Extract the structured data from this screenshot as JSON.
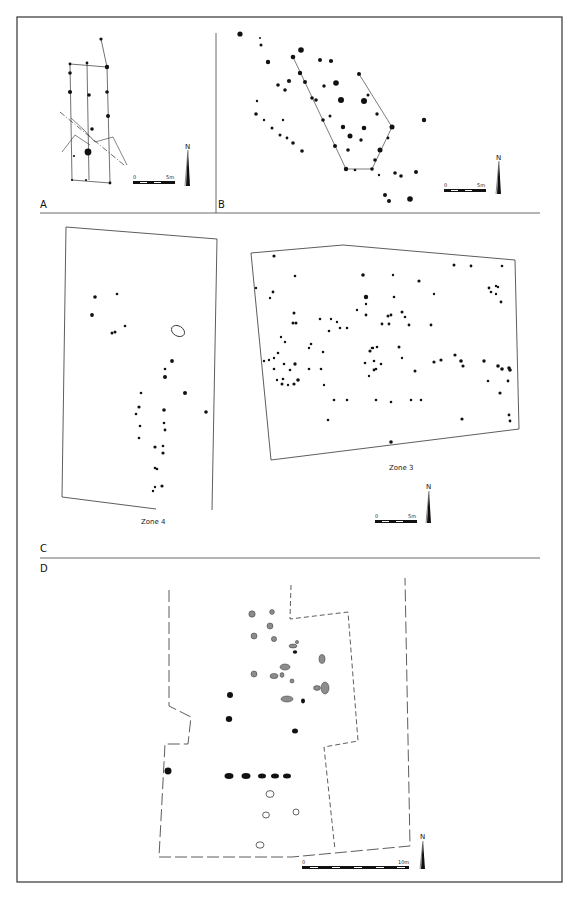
{
  "header_fragment": "",
  "panels": {
    "A": {
      "label": "A",
      "scale": {
        "start": "0",
        "end": "5m"
      },
      "north": "N"
    },
    "B": {
      "label": "B",
      "scale": {
        "start": "0",
        "end": "5m"
      },
      "north": "N"
    },
    "C": {
      "label": "C",
      "zone4_label": "Zone 4",
      "zone3_label": "Zone 3",
      "scale": {
        "start": "0",
        "end": "5m"
      },
      "north": "N"
    },
    "D": {
      "label": "D",
      "scale": {
        "start": "0",
        "end": "10m"
      },
      "north": "N"
    }
  },
  "colors": {
    "ink": "#111111",
    "frame": "#333333",
    "grey_fill": "#8c8c8c"
  },
  "geometry": {
    "A_posts": [
      [
        101,
        39,
        1.6
      ],
      [
        70,
        64,
        1.4
      ],
      [
        87,
        63,
        1.4
      ],
      [
        107,
        67,
        2.2
      ],
      [
        70,
        73,
        1.8
      ],
      [
        70,
        92,
        2.1
      ],
      [
        89,
        95,
        1.8
      ],
      [
        107,
        92,
        1.8
      ],
      [
        108,
        116,
        2.0
      ],
      [
        92,
        129,
        1.8
      ],
      [
        88,
        152,
        3.4
      ],
      [
        74,
        156,
        1.1
      ],
      [
        72,
        180,
        1.1
      ],
      [
        86,
        180,
        1.1
      ],
      [
        110,
        183,
        1.4
      ]
    ],
    "A_lines": [
      [
        [
          101,
          39
        ],
        [
          107,
          67
        ]
      ],
      [
        [
          70,
          64
        ],
        [
          107,
          67
        ]
      ],
      [
        [
          70,
          64
        ],
        [
          72,
          180
        ]
      ],
      [
        [
          87,
          63
        ],
        [
          89,
          180
        ]
      ],
      [
        [
          107,
          67
        ],
        [
          110,
          183
        ]
      ],
      [
        [
          72,
          180
        ],
        [
          110,
          183
        ]
      ]
    ],
    "A_dash": [
      [
        [
          60,
          112
        ],
        [
          124,
          165
        ]
      ]
    ],
    "A_trench": [
      [
        [
          71,
          118
        ],
        [
          84,
          130
        ],
        [
          95,
          142
        ],
        [
          113,
          137
        ],
        [
          127,
          165
        ]
      ],
      [
        [
          62,
          152
        ],
        [
          75,
          135
        ],
        [
          90,
          145
        ]
      ]
    ],
    "B_posts": [
      [
        240,
        34,
        2.6
      ],
      [
        260,
        38,
        1
      ],
      [
        261,
        45,
        1.5
      ],
      [
        301,
        50,
        2.8
      ],
      [
        268,
        62,
        2.2
      ],
      [
        293,
        57,
        2.3
      ],
      [
        320,
        60,
        2
      ],
      [
        331,
        61,
        2.1
      ],
      [
        300,
        73,
        2.2
      ],
      [
        289,
        81,
        2.1
      ],
      [
        359,
        74,
        2
      ],
      [
        305,
        82,
        2
      ],
      [
        336,
        83,
        2.8
      ],
      [
        278,
        85,
        1.8
      ],
      [
        285,
        90,
        1.8
      ],
      [
        324,
        86,
        1.7
      ],
      [
        312,
        98,
        1.8
      ],
      [
        316,
        100,
        1.8
      ],
      [
        341,
        100,
        3.0
      ],
      [
        364,
        101,
        3.0
      ],
      [
        368,
        95,
        1.5
      ],
      [
        257,
        101,
        1.2
      ],
      [
        256,
        114,
        1.8
      ],
      [
        264,
        120,
        1.2
      ],
      [
        283,
        120,
        1.2
      ],
      [
        323,
        120,
        1.8
      ],
      [
        330,
        116,
        1.5
      ],
      [
        377,
        114,
        1.7
      ],
      [
        424,
        120,
        2.2
      ],
      [
        392,
        127,
        2.5
      ],
      [
        343,
        127,
        2.2
      ],
      [
        364,
        128,
        2.3
      ],
      [
        272,
        128,
        1.5
      ],
      [
        280,
        135,
        1.5
      ],
      [
        287,
        138,
        1.4
      ],
      [
        350,
        136,
        2.5
      ],
      [
        361,
        140,
        1.7
      ],
      [
        388,
        138,
        1.4
      ],
      [
        293,
        143,
        1.8
      ],
      [
        335,
        146,
        2.0
      ],
      [
        348,
        150,
        1.8
      ],
      [
        380,
        150,
        2.5
      ],
      [
        302,
        151,
        1.8
      ],
      [
        375,
        160,
        1.8
      ],
      [
        346,
        169,
        2.2
      ],
      [
        355,
        170,
        1.3
      ],
      [
        372,
        169,
        1.8
      ],
      [
        379,
        175,
        1.2
      ],
      [
        395,
        173,
        1.8
      ],
      [
        401,
        176,
        1.8
      ],
      [
        416,
        172,
        2.0
      ],
      [
        385,
        195,
        2.0
      ],
      [
        389,
        201,
        2.0
      ],
      [
        410,
        199,
        2.8
      ]
    ],
    "B_lines": [
      [
        [
          293,
          57
        ],
        [
          346,
          169
        ]
      ],
      [
        [
          359,
          74
        ],
        [
          392,
          127
        ]
      ],
      [
        [
          392,
          127
        ],
        [
          372,
          169
        ]
      ],
      [
        [
          346,
          169
        ],
        [
          372,
          169
        ]
      ]
    ],
    "Z4_poly": [
      [
        66,
        227
      ],
      [
        217,
        239
      ],
      [
        212,
        510
      ]
    ],
    "Z4_poly2": [
      [
        66,
        227
      ],
      [
        62,
        497
      ],
      [
        156,
        509
      ]
    ],
    "Z4_posts": [
      [
        95,
        297,
        1.8
      ],
      [
        117,
        294,
        1.3
      ],
      [
        92,
        315,
        1.9
      ],
      [
        125,
        326,
        1.3
      ],
      [
        112,
        333,
        1.5
      ],
      [
        115,
        332,
        1.5
      ],
      [
        172,
        361,
        1.9
      ],
      [
        165,
        369,
        1.3
      ],
      [
        165,
        377,
        2.0
      ],
      [
        185,
        393,
        2.0
      ],
      [
        206,
        412,
        1.8
      ],
      [
        141,
        393,
        1.3
      ],
      [
        139,
        407,
        1.6
      ],
      [
        136,
        414,
        1.3
      ],
      [
        140,
        426,
        1.3
      ],
      [
        164,
        410,
        1.8
      ],
      [
        164,
        423,
        1.3
      ],
      [
        165,
        430,
        1.4
      ],
      [
        139,
        438,
        1.3
      ],
      [
        155,
        447,
        1.6
      ],
      [
        163,
        446,
        1.3
      ],
      [
        163,
        453,
        1.6
      ],
      [
        155,
        468,
        1.3
      ],
      [
        157,
        469,
        1.3
      ],
      [
        162,
        486,
        1.6
      ],
      [
        155,
        487,
        1.2
      ],
      [
        153,
        491,
        1.2
      ]
    ],
    "Z4_oval": [
      178,
      331,
      7,
      5
    ],
    "Z3_poly": [
      [
        251,
        253
      ],
      [
        343,
        245
      ],
      [
        515,
        260
      ],
      [
        519,
        429
      ],
      [
        271,
        460
      ]
    ],
    "Z3_posts": [
      [
        274,
        256,
        1.6
      ],
      [
        295,
        276,
        1.3
      ],
      [
        363,
        275,
        1.8
      ],
      [
        454,
        265,
        1.5
      ],
      [
        471,
        266,
        1.4
      ],
      [
        502,
        266,
        1.3
      ],
      [
        256,
        288,
        1.2
      ],
      [
        273,
        292,
        1.4
      ],
      [
        270,
        298,
        1.2
      ],
      [
        294,
        313,
        1.5
      ],
      [
        393,
        275,
        1.2
      ],
      [
        419,
        281,
        1.6
      ],
      [
        394,
        297,
        1.3
      ],
      [
        434,
        294,
        1.2
      ],
      [
        489,
        288,
        1.4
      ],
      [
        496,
        286,
        1.2
      ],
      [
        491,
        292,
        1.3
      ],
      [
        498,
        287,
        1.2
      ],
      [
        496,
        294,
        1.2
      ],
      [
        501,
        302,
        1.4
      ],
      [
        366,
        297,
        2.2
      ],
      [
        366,
        304,
        1.2
      ],
      [
        296,
        323,
        1.5
      ],
      [
        293,
        323,
        1.5
      ],
      [
        388,
        316,
        1.5
      ],
      [
        391,
        315,
        1.4
      ],
      [
        382,
        324,
        1.4
      ],
      [
        366,
        315,
        1.4
      ],
      [
        402,
        312,
        1.5
      ],
      [
        405,
        317,
        1.3
      ],
      [
        389,
        324,
        1.4
      ],
      [
        409,
        325,
        1.4
      ],
      [
        431,
        325,
        1.4
      ],
      [
        311,
        344,
        1.3
      ],
      [
        278,
        353,
        1.3
      ],
      [
        281,
        337,
        1.2
      ],
      [
        285,
        342,
        1.2
      ],
      [
        264,
        361,
        1.2
      ],
      [
        269,
        360,
        1.2
      ],
      [
        284,
        364,
        1.3
      ],
      [
        295,
        364,
        1.7
      ],
      [
        290,
        370,
        1.3
      ],
      [
        283,
        379,
        1.3
      ],
      [
        282,
        384,
        1.5
      ],
      [
        298,
        380,
        1.8
      ],
      [
        294,
        384,
        1.6
      ],
      [
        288,
        385,
        1.2
      ],
      [
        309,
        348,
        1.2
      ],
      [
        320,
        319,
        1.3
      ],
      [
        340,
        328,
        1.3
      ],
      [
        347,
        328,
        1.3
      ],
      [
        329,
        331,
        1.3
      ],
      [
        331,
        319,
        1.2
      ],
      [
        357,
        310,
        1.2
      ],
      [
        337,
        322,
        1.2
      ],
      [
        323,
        352,
        1.3
      ],
      [
        274,
        369,
        1.3
      ],
      [
        277,
        380,
        1.2
      ],
      [
        309,
        369,
        1.3
      ],
      [
        321,
        369,
        1.3
      ],
      [
        274,
        358,
        1.2
      ],
      [
        370,
        351,
        1.6
      ],
      [
        373,
        348,
        1.2
      ],
      [
        374,
        361,
        1.3
      ],
      [
        372,
        348,
        1.3
      ],
      [
        377,
        347,
        1.3
      ],
      [
        399,
        347,
        1.5
      ],
      [
        381,
        364,
        1.3
      ],
      [
        376,
        369,
        1.3
      ],
      [
        369,
        376,
        1.2
      ],
      [
        365,
        363,
        1.3
      ],
      [
        374,
        370,
        1.4
      ],
      [
        402,
        358,
        1.2
      ],
      [
        415,
        371,
        1.5
      ],
      [
        434,
        362,
        1.6
      ],
      [
        441,
        360,
        1.6
      ],
      [
        455,
        355,
        1.6
      ],
      [
        461,
        361,
        1.8
      ],
      [
        463,
        366,
        1.6
      ],
      [
        484,
        361,
        1.7
      ],
      [
        498,
        366,
        1.8
      ],
      [
        502,
        369,
        1.8
      ],
      [
        509,
        368,
        1.8
      ],
      [
        510,
        370,
        1.8
      ],
      [
        508,
        381,
        1.4
      ],
      [
        488,
        381,
        1.3
      ],
      [
        500,
        393,
        1.6
      ],
      [
        324,
        385,
        1.2
      ],
      [
        334,
        400,
        1.3
      ],
      [
        347,
        400,
        1.3
      ],
      [
        376,
        400,
        1.3
      ],
      [
        391,
        402,
        1.3
      ],
      [
        411,
        400,
        1.3
      ],
      [
        421,
        400,
        1.3
      ],
      [
        328,
        420,
        1.3
      ],
      [
        462,
        419,
        1.6
      ],
      [
        509,
        415,
        1.4
      ],
      [
        510,
        421,
        1.4
      ],
      [
        391,
        442,
        1.8
      ]
    ],
    "D_grey": [
      [
        252,
        614,
        3.2,
        3.2
      ],
      [
        272,
        612,
        2.4,
        2.4
      ],
      [
        270,
        626,
        3,
        3
      ],
      [
        254,
        636,
        3,
        3
      ],
      [
        274,
        639,
        2.6,
        2.6
      ],
      [
        293,
        646,
        4,
        2
      ],
      [
        297,
        642,
        1.6,
        1.6
      ],
      [
        322,
        659,
        3,
        4.4
      ],
      [
        285,
        667,
        5,
        3
      ],
      [
        254,
        674,
        3,
        3
      ],
      [
        274,
        676,
        4,
        2.6
      ],
      [
        282,
        675,
        2,
        2.4
      ],
      [
        292,
        681,
        2,
        2
      ],
      [
        325,
        688,
        4,
        6
      ],
      [
        317,
        688,
        3.4,
        2.4
      ],
      [
        287,
        699,
        6,
        3
      ]
    ],
    "D_black": [
      [
        295,
        652,
        2.2,
        1.8
      ],
      [
        230,
        695,
        3,
        3
      ],
      [
        229,
        719,
        3.2,
        3
      ],
      [
        303,
        701,
        2,
        2.4
      ],
      [
        295,
        731,
        3,
        2.5
      ],
      [
        168,
        771,
        3.5,
        3.4
      ],
      [
        229,
        776,
        4.5,
        3
      ],
      [
        246,
        776,
        4.5,
        3
      ],
      [
        262,
        776,
        4,
        2.5
      ],
      [
        275,
        776,
        4,
        2.5
      ],
      [
        287,
        776,
        4,
        2.5
      ]
    ],
    "D_open": [
      [
        270,
        794,
        4,
        3.4
      ],
      [
        266,
        815,
        3.4,
        3
      ],
      [
        296,
        812,
        3,
        3
      ],
      [
        260,
        845,
        4,
        3.2
      ]
    ],
    "D_outer": [
      [
        169,
        590
      ],
      [
        169,
        706
      ],
      [
        191,
        717
      ],
      [
        188,
        744
      ],
      [
        165,
        744
      ],
      [
        159,
        857
      ],
      [
        292,
        857
      ],
      [
        410,
        846
      ],
      [
        405,
        578
      ]
    ],
    "D_inner": [
      [
        291,
        585
      ],
      [
        290,
        619
      ],
      [
        348,
        612
      ],
      [
        358,
        741
      ],
      [
        324,
        747
      ],
      [
        335,
        850
      ]
    ]
  }
}
